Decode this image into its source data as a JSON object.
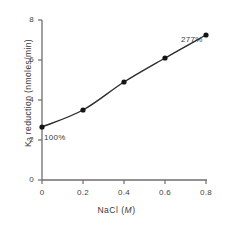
{
  "chart_data": {
    "type": "line",
    "title": "",
    "subtitle": "",
    "xlabel": "NaCl (M)",
    "xlabel_parts": {
      "text": "NaCl (",
      "unit": "M",
      "close": ")"
    },
    "ylabel": "K3 reduction (nmoles/min)",
    "ylabel_parts": {
      "prefix": "K",
      "sub": "3",
      "rest": " reduction  (nmoles/min)"
    },
    "x": [
      0,
      0.2,
      0.4,
      0.6,
      0.8
    ],
    "values": [
      2.65,
      3.5,
      4.9,
      6.1,
      7.25
    ],
    "xticks": [
      0,
      0.2,
      0.4,
      0.6,
      0.8
    ],
    "xtick_labels": [
      "0",
      "0.2",
      "0.4",
      "0.6",
      "0.8"
    ],
    "yticks": [
      0,
      2,
      4,
      6,
      8
    ],
    "ytick_labels": [
      "0",
      "2",
      "4",
      "6",
      "8"
    ],
    "xlim": [
      0,
      0.88
    ],
    "ylim": [
      0,
      8
    ],
    "grid": false,
    "legend": false,
    "marker": "filled-circle",
    "line_color": "#2b2b2b",
    "marker_color": "#151515",
    "axis_color": "#6e6e6e",
    "background_color": "#ffffff",
    "annotations": [
      {
        "text": "100%",
        "x": 0,
        "y": 2.65
      },
      {
        "text": "277%",
        "x": 0.8,
        "y": 7.25
      }
    ]
  },
  "annotations": {
    "first_point_label": "100%",
    "last_point_label": "277%"
  },
  "axes": {
    "x_tick_labels": [
      "0",
      "0.2",
      "0.4",
      "0.6",
      "0.8"
    ],
    "y_tick_labels": [
      "0",
      "2",
      "4",
      "6",
      "8"
    ]
  }
}
